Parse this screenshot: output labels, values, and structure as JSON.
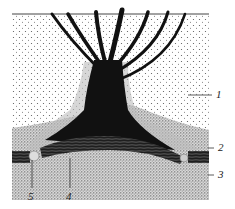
{
  "figure": {
    "type": "scientific-illustration",
    "labels": [
      {
        "id": "1",
        "text": "1"
      },
      {
        "id": "2",
        "text": "2"
      },
      {
        "id": "3",
        "text": "3"
      },
      {
        "id": "4",
        "text": "4"
      },
      {
        "id": "5",
        "text": "5"
      }
    ],
    "colors": {
      "background": "#ffffff",
      "upper_layer": "#f2f2f2",
      "lower_layer": "#b8b8b8",
      "structure": "#111111",
      "band": "#3a3a3a",
      "line": "#444444"
    }
  }
}
